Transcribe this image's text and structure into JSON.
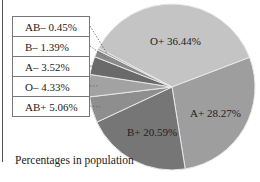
{
  "chart_data": {
    "type": "pie",
    "title": "",
    "caption": "Percentages in population",
    "categories": [
      "O+",
      "A+",
      "B+",
      "AB+",
      "O−",
      "A−",
      "B−",
      "AB−"
    ],
    "values": [
      36.44,
      28.27,
      20.59,
      5.06,
      4.33,
      3.52,
      1.39,
      0.45
    ],
    "labels": {
      "o_pos": "O+ 36.44%",
      "a_pos": "A+ 28.27%",
      "b_pos": "B+ 20.59%",
      "ab_neg": "AB– 0.45%",
      "b_neg": "B– 1.39%",
      "a_neg": "A– 3.52%",
      "o_neg": "O– 4.33%",
      "ab_pos": "AB+ 5.06%"
    },
    "colors": [
      "#c4c4c4",
      "#9e9e9e",
      "#767676",
      "#8e8e8e",
      "#a2a2a2",
      "#6a6a6a",
      "#8a8a8a",
      "#b0b0b0"
    ],
    "legend_position": "left (callout box)"
  }
}
